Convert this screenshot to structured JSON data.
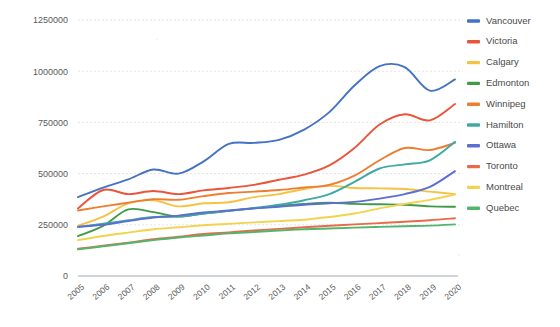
{
  "chart_data": {
    "type": "line",
    "title": "",
    "xlabel": "",
    "ylabel": "",
    "x": [
      2005,
      2006,
      2007,
      2008,
      2009,
      2010,
      2011,
      2012,
      2013,
      2014,
      2015,
      2016,
      2017,
      2018,
      2019,
      2020
    ],
    "categories": [
      "2005",
      "2006",
      "2007",
      "2008",
      "2009",
      "2010",
      "2011",
      "2012",
      "2013",
      "2014",
      "2015",
      "2016",
      "2017",
      "2018",
      "2019",
      "2020"
    ],
    "ylim": [
      0,
      1250000
    ],
    "yticks": [
      0,
      250000,
      500000,
      750000,
      1000000,
      1250000
    ],
    "ytick_labels": [
      "0",
      "250000",
      "500000",
      "750000",
      "1000000",
      "1250000"
    ],
    "grid": true,
    "legend_position": "right",
    "smoothing": "spline",
    "series": [
      {
        "name": "Vancouver",
        "color": "#4472c4",
        "values": [
          385000,
          432000,
          472000,
          520000,
          500000,
          560000,
          645000,
          650000,
          665000,
          715000,
          800000,
          930000,
          1025000,
          1020000,
          905000,
          960000
        ]
      },
      {
        "name": "Victoria",
        "color": "#e8553a",
        "values": [
          330000,
          420000,
          400000,
          415000,
          400000,
          418000,
          430000,
          445000,
          470000,
          495000,
          540000,
          625000,
          740000,
          790000,
          760000,
          840000
        ]
      },
      {
        "name": "Calgary",
        "color": "#f5c242",
        "values": [
          245000,
          290000,
          355000,
          370000,
          340000,
          355000,
          360000,
          385000,
          400000,
          425000,
          440000,
          430000,
          428000,
          425000,
          412000,
          400000
        ]
      },
      {
        "name": "Edmonton",
        "color": "#3f9b46",
        "values": [
          195000,
          245000,
          325000,
          312000,
          290000,
          305000,
          318000,
          330000,
          342000,
          352000,
          358000,
          352000,
          350000,
          348000,
          340000,
          338000
        ]
      },
      {
        "name": "Winnipeg",
        "color": "#ed7d31",
        "values": [
          320000,
          340000,
          358000,
          375000,
          372000,
          390000,
          405000,
          412000,
          420000,
          432000,
          445000,
          490000,
          565000,
          625000,
          615000,
          650000
        ]
      },
      {
        "name": "Hamilton",
        "color": "#3fa9a5",
        "values": [
          240000,
          255000,
          272000,
          288000,
          290000,
          305000,
          318000,
          332000,
          348000,
          370000,
          400000,
          460000,
          525000,
          545000,
          565000,
          655000
        ]
      },
      {
        "name": "Ottawa",
        "color": "#5b6fd1",
        "values": [
          240000,
          250000,
          268000,
          285000,
          295000,
          310000,
          320000,
          330000,
          338000,
          348000,
          355000,
          362000,
          378000,
          400000,
          435000,
          512000
        ]
      },
      {
        "name": "Toronto",
        "color": "#e76a4a",
        "values": [
          133000,
          148000,
          163000,
          180000,
          192000,
          205000,
          213000,
          222000,
          230000,
          238000,
          245000,
          252000,
          258000,
          265000,
          272000,
          282000
        ]
      },
      {
        "name": "Montreal",
        "color": "#f2d34e",
        "values": [
          175000,
          195000,
          212000,
          228000,
          238000,
          248000,
          255000,
          262000,
          268000,
          275000,
          288000,
          305000,
          330000,
          352000,
          372000,
          398000
        ]
      },
      {
        "name": "Quebec",
        "color": "#52b56b",
        "values": [
          130000,
          145000,
          160000,
          175000,
          188000,
          198000,
          208000,
          215000,
          222000,
          228000,
          232000,
          236000,
          240000,
          243000,
          246000,
          252000
        ]
      }
    ]
  },
  "legend": {
    "items": [
      {
        "label": "Vancouver"
      },
      {
        "label": "Victoria"
      },
      {
        "label": "Calgary"
      },
      {
        "label": "Edmonton"
      },
      {
        "label": "Winnipeg"
      },
      {
        "label": "Hamilton"
      },
      {
        "label": "Ottawa"
      },
      {
        "label": "Toronto"
      },
      {
        "label": "Montreal"
      },
      {
        "label": "Quebec"
      }
    ]
  }
}
